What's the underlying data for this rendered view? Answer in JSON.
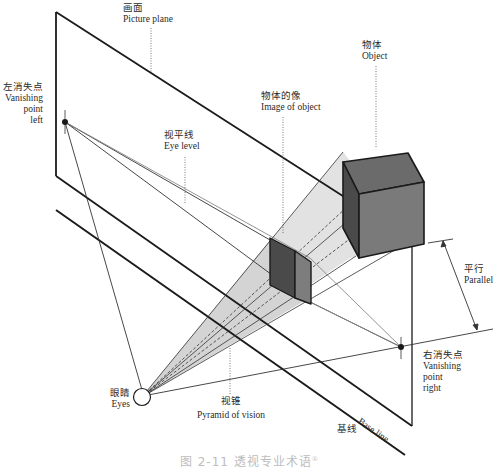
{
  "figure": {
    "caption_number": "图 2-11",
    "caption_text": "透视专业术语",
    "caption_footnote": "①"
  },
  "labels": {
    "picture_plane": {
      "zh": "画面",
      "en": "Picture plane"
    },
    "vanishing_point_left": {
      "zh": "左消失点",
      "en1": "Vanishing",
      "en2": "point",
      "en3": "left"
    },
    "eye_level": {
      "zh": "视平线",
      "en": "Eye level"
    },
    "image_of_object": {
      "zh": "物体的像",
      "en": "Image of object"
    },
    "object": {
      "zh": "物体",
      "en": "Object"
    },
    "parallel": {
      "zh": "平行",
      "en": "Parallel"
    },
    "vanishing_point_right": {
      "zh": "右消失点",
      "en1": "Vanishing",
      "en2": "point",
      "en3": "right"
    },
    "eyes": {
      "zh": "眼睛",
      "en": "Eyes"
    },
    "pyramid_of_vision": {
      "zh": "视锥",
      "en": "Pyramid of vision"
    },
    "base_line": {
      "zh": "基线",
      "en": "Base line"
    }
  },
  "colors": {
    "line": "#1a1a1a",
    "cone_fill": "#d9d9d9",
    "cube_top": "#6b6b6b",
    "cube_front": "#7a7a7a",
    "cube_side": "#4a4a4a",
    "image_dark": "#4a4a4a",
    "image_light": "#7d7d7d",
    "caption": "#bdbdbd"
  }
}
